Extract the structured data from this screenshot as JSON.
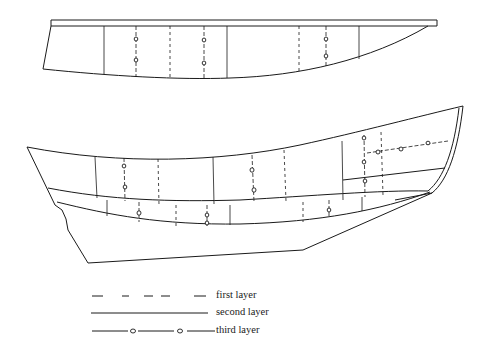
{
  "figure": {
    "type": "technical-drawing",
    "views": [
      {
        "id": "upper-hull",
        "description": "side view of hull section with flat top rail"
      },
      {
        "id": "lower-hull",
        "description": "side view of full hull with raked stem and transom"
      }
    ],
    "line_color": "#1a1a1a",
    "background": "#ffffff"
  },
  "legend": {
    "items": [
      {
        "label": "first layer",
        "style": "dashed"
      },
      {
        "label": "second layer",
        "style": "solid"
      },
      {
        "label": "third layer",
        "style": "solid-with-fasteners"
      }
    ]
  }
}
